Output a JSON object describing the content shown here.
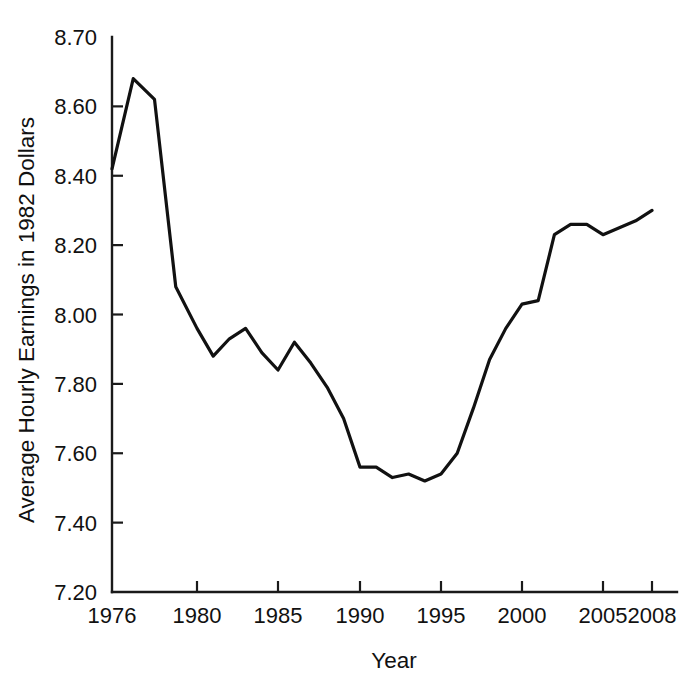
{
  "chart_data": {
    "type": "line",
    "title": "",
    "xlabel": "Year",
    "ylabel": "Average Hourly Earnings in 1982 Dollars",
    "grid": false,
    "legend": "none",
    "xlim": [
      1976,
      2008
    ],
    "ylim": [
      7.2,
      8.7
    ],
    "y_axis_note": "Non-uniform top interval: 8.60 to 8.70 drawn the same height as the 0.20 intervals below it",
    "xticks": [
      1976,
      1980,
      1985,
      1990,
      1995,
      2000,
      2005,
      2008
    ],
    "xtick_labels": [
      "1976",
      "1980",
      "1985",
      "1990",
      "1995",
      "2000",
      "2005",
      "2008"
    ],
    "yticks": [
      7.2,
      7.4,
      7.6,
      7.8,
      8.0,
      8.2,
      8.4,
      8.6,
      8.7
    ],
    "ytick_labels": [
      "7.20",
      "7.40",
      "7.60",
      "7.80",
      "8.00",
      "8.20",
      "8.40",
      "8.60",
      "8.70"
    ],
    "x": [
      1976,
      1977,
      1978,
      1979,
      1980,
      1981,
      1982,
      1983,
      1984,
      1985,
      1986,
      1987,
      1988,
      1989,
      1990,
      1991,
      1992,
      1993,
      1994,
      1995,
      1996,
      1997,
      1998,
      1999,
      2000,
      2001,
      2002,
      2003,
      2004,
      2005,
      2006,
      2007,
      2008
    ],
    "series": [
      {
        "name": "Average Hourly Earnings in 1982 Dollars",
        "color": "#111111",
        "values": [
          8.42,
          8.64,
          8.61,
          8.08,
          7.96,
          7.88,
          7.93,
          7.96,
          7.89,
          7.84,
          7.92,
          7.86,
          7.79,
          7.7,
          7.56,
          7.56,
          7.53,
          7.54,
          7.52,
          7.54,
          7.6,
          7.73,
          7.87,
          7.96,
          8.03,
          8.04,
          8.23,
          8.26,
          8.26,
          8.23,
          8.25,
          8.27,
          8.3
        ]
      }
    ]
  },
  "figure": {
    "background_color": "#ffffff",
    "axis_color": "#111111",
    "line_color": "#111111"
  }
}
